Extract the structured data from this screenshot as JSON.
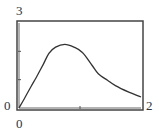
{
  "chart_data": {
    "type": "line",
    "title": "",
    "xlabel": "",
    "ylabel": "",
    "xlim": [
      0,
      2
    ],
    "ylim": [
      0,
      3
    ],
    "x_tick_labels": {
      "min": "0",
      "max": "2"
    },
    "y_tick_labels": {
      "min": "0",
      "max": "3"
    },
    "x_ticks": [
      1
    ],
    "y_ticks": [
      1,
      2
    ],
    "grid": false,
    "legend": null,
    "series": [
      {
        "name": "f(x)",
        "x": [
          0,
          0.1,
          0.2,
          0.28,
          0.4,
          0.49,
          0.6,
          0.75,
          0.9,
          1.04,
          1.2,
          1.3,
          1.45,
          1.58,
          1.8,
          2.0
        ],
        "y": [
          0,
          0.38,
          0.77,
          1.07,
          1.55,
          1.93,
          2.15,
          2.25,
          2.15,
          1.96,
          1.5,
          1.21,
          0.98,
          0.79,
          0.56,
          0.39
        ]
      }
    ]
  },
  "labels": {
    "y_max": "3",
    "y_min": "0",
    "x_min": "0",
    "x_max": "2"
  },
  "colors": {
    "frame": "#3a3a3a",
    "curve": "#3a3a3a"
  }
}
